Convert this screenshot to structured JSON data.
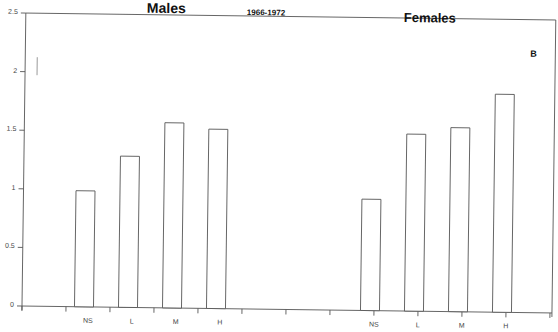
{
  "chart_data": {
    "type": "bar",
    "title": "1966-1972",
    "panel_label": "B",
    "groups": [
      {
        "name": "Males",
        "categories": [
          "NS",
          "L",
          "M",
          "H"
        ],
        "values": [
          0.99,
          1.29,
          1.58,
          1.53
        ]
      },
      {
        "name": "Females",
        "categories": [
          "NS",
          "L",
          "M",
          "H"
        ],
        "values": [
          0.95,
          1.51,
          1.57,
          1.86
        ]
      }
    ],
    "categories": [
      "NS",
      "L",
      "M",
      "H"
    ],
    "series": [
      {
        "name": "Males",
        "values": [
          0.99,
          1.29,
          1.58,
          1.53
        ]
      },
      {
        "name": "Females",
        "values": [
          0.95,
          1.51,
          1.57,
          1.86
        ]
      }
    ],
    "xlabel": "",
    "ylabel": "",
    "ylim": [
      0,
      2.5
    ],
    "yticks": [
      "0",
      "0.5",
      "1",
      "1.5",
      "2",
      "2.5"
    ],
    "grid": false,
    "legend": "none",
    "bar_fill": "#ffffff",
    "bar_stroke": "#555555"
  },
  "labels": {
    "males": "Males",
    "females": "Females",
    "period": "1966-1972",
    "panel": "B"
  }
}
